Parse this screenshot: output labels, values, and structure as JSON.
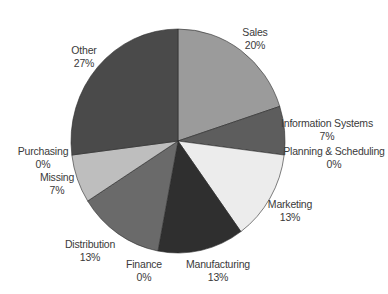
{
  "chart_data": {
    "type": "pie",
    "title": "",
    "start_angle_deg": 0,
    "direction": "clockwise",
    "slices": [
      {
        "label": "Sales",
        "value": 20,
        "pct_label": "20%",
        "color": "#9b9b9b",
        "lx": 255,
        "ly": 26
      },
      {
        "label": "Information Systems",
        "value": 7,
        "pct_label": "7%",
        "color": "#5d5d5d",
        "lx": 327,
        "ly": 117
      },
      {
        "label": "Planning & Scheduling",
        "value": 0,
        "pct_label": "0%",
        "color": "#808080",
        "lx": 334,
        "ly": 145
      },
      {
        "label": "Marketing",
        "value": 13,
        "pct_label": "13%",
        "color": "#ececec",
        "lx": 290,
        "ly": 198
      },
      {
        "label": "Manufacturing",
        "value": 13,
        "pct_label": "13%",
        "color": "#2f2f2f",
        "lx": 218,
        "ly": 258
      },
      {
        "label": "Finance",
        "value": 0,
        "pct_label": "0%",
        "color": "#808080",
        "lx": 144,
        "ly": 258
      },
      {
        "label": "Distribution",
        "value": 13,
        "pct_label": "13%",
        "color": "#6a6a6a",
        "lx": 90,
        "ly": 238
      },
      {
        "label": "Missing",
        "value": 7,
        "pct_label": "7%",
        "color": "#bebebe",
        "lx": 57,
        "ly": 171
      },
      {
        "label": "Purchasing",
        "value": 0,
        "pct_label": "0%",
        "color": "#808080",
        "lx": 43,
        "ly": 145
      },
      {
        "label": "Other",
        "value": 27,
        "pct_label": "27%",
        "color": "#4a4a4a",
        "lx": 84,
        "ly": 44
      }
    ],
    "counts_equivalent": {
      "Sales": 3,
      "Information Systems": 1,
      "Planning & Scheduling": 0,
      "Marketing": 2,
      "Manufacturing": 2,
      "Finance": 0,
      "Distribution": 2,
      "Missing": 1,
      "Purchasing": 0,
      "Other": 4
    },
    "legend": "none (labels placed beside slices)"
  }
}
